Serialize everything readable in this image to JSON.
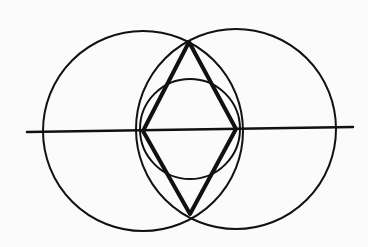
{
  "diagram": {
    "title": "",
    "stroke_color": "#111111",
    "background": "#fbfbfb",
    "axis_line": {
      "x1": 27,
      "y1": 132,
      "x2": 353,
      "y2": 127
    },
    "circles": [
      {
        "name": "left-circle",
        "cx": 143,
        "cy": 131,
        "r": 100
      },
      {
        "name": "right-circle",
        "cx": 236,
        "cy": 129,
        "r": 100
      },
      {
        "name": "center-circle",
        "cx": 190,
        "cy": 129,
        "r": 50
      }
    ],
    "rhombus": {
      "points": [
        [
          189,
          42
        ],
        [
          236,
          129
        ],
        [
          190,
          214
        ],
        [
          143,
          131
        ]
      ]
    }
  }
}
